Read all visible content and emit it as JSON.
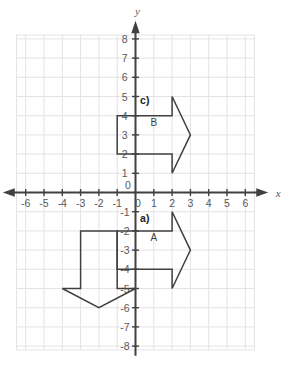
{
  "figure": {
    "title": "",
    "axes": {
      "x_label": "x",
      "y_label": "y",
      "x_ticks": [
        "-6",
        "-5",
        "-4",
        "-3",
        "-2",
        "-1",
        "0"
      ],
      "y_ticks_positive": [
        "1",
        "2",
        "3",
        "4",
        "5",
        "6",
        "7",
        "8"
      ],
      "y_ticks_negative": [
        "-1",
        "-2",
        "-3",
        "-4",
        "-5",
        "-6",
        "-7",
        "-8"
      ],
      "origin_label": "0",
      "x_range": [
        -6.5,
        6.5
      ],
      "y_range": [
        -8,
        8
      ],
      "grid": true,
      "grid_color": "#e3e3e6",
      "axis_color": "#404042"
    },
    "part_labels": [
      {
        "id": "part-c",
        "text": "c)",
        "x": 0.25,
        "y": 4.6
      },
      {
        "id": "part-a",
        "text": "a)",
        "x": 0.25,
        "y": -1.55
      }
    ],
    "shapes": [
      {
        "id": "shape-b",
        "label": "B",
        "label_x": 1.0,
        "label_y": 3.45,
        "type": "right-arrow",
        "stroke": "#404042",
        "points": [
          [
            -1,
            4
          ],
          [
            2,
            4
          ],
          [
            2,
            5
          ],
          [
            3,
            3
          ],
          [
            2,
            1
          ],
          [
            2,
            2
          ],
          [
            -1,
            2
          ]
        ]
      },
      {
        "id": "shape-a",
        "label": "A",
        "label_x": 1.0,
        "label_y": -2.55,
        "type": "right-arrow",
        "stroke": "#404042",
        "points": [
          [
            -1,
            -2
          ],
          [
            2,
            -2
          ],
          [
            2,
            -1
          ],
          [
            3,
            -3
          ],
          [
            2,
            -5
          ],
          [
            2,
            -4
          ],
          [
            -1,
            -4
          ]
        ]
      },
      {
        "id": "shape-down",
        "label": "",
        "label_x": null,
        "label_y": null,
        "type": "down-arrow",
        "stroke": "#404042",
        "points": [
          [
            -3,
            -2
          ],
          [
            -1,
            -2
          ],
          [
            -1,
            -5
          ],
          [
            0,
            -5
          ],
          [
            -2,
            -6
          ],
          [
            -4,
            -5
          ],
          [
            -3,
            -5
          ]
        ]
      }
    ]
  }
}
